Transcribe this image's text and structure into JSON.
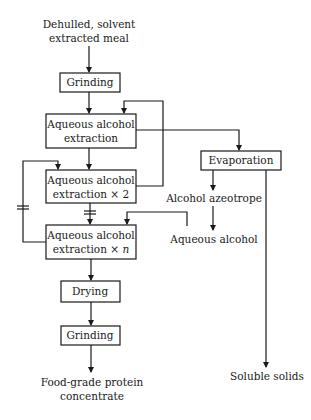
{
  "diagram": {
    "type": "process-flowchart",
    "start": {
      "line1": "Dehulled, solvent",
      "line2": "extracted meal"
    },
    "boxes": {
      "grinding1": "Grinding",
      "extraction1": {
        "line1": "Aqueous alcohol",
        "line2": "extraction"
      },
      "extraction2": {
        "line1": "Aqueous alcohol",
        "line2": "extraction × 2"
      },
      "extractionN": {
        "line1": "Aqueous alcohol",
        "line2": "extraction × ",
        "n": "n"
      },
      "evaporation": "Evaporation",
      "drying": "Drying",
      "grinding2": "Grinding"
    },
    "labels": {
      "alcohol_azeotrope": "Alcohol azeotrope",
      "aqueous_alcohol": "Aqueous alcohol",
      "soluble_solids": "Soluble solids"
    },
    "end": {
      "line1": "Food-grade protein",
      "line2": "concentrate"
    },
    "edges": [
      {
        "from": "start",
        "to": "grinding1"
      },
      {
        "from": "grinding1",
        "to": "extraction1"
      },
      {
        "from": "extraction1",
        "to": "extraction2"
      },
      {
        "from": "extraction1",
        "to": "evaporation"
      },
      {
        "from": "extraction2",
        "to": "extraction1",
        "note": "recycle"
      },
      {
        "from": "extraction2",
        "to": "extractionN",
        "note": "interrupted"
      },
      {
        "from": "extractionN",
        "to": "extraction2",
        "note": "recycle, interrupted"
      },
      {
        "from": "evaporation",
        "to": "alcohol_azeotrope"
      },
      {
        "from": "alcohol_azeotrope",
        "to": "aqueous_alcohol"
      },
      {
        "from": "aqueous_alcohol",
        "to": "extractionN"
      },
      {
        "from": "evaporation",
        "to": "soluble_solids"
      },
      {
        "from": "extractionN",
        "to": "drying"
      },
      {
        "from": "drying",
        "to": "grinding2"
      },
      {
        "from": "grinding2",
        "to": "end"
      }
    ]
  }
}
